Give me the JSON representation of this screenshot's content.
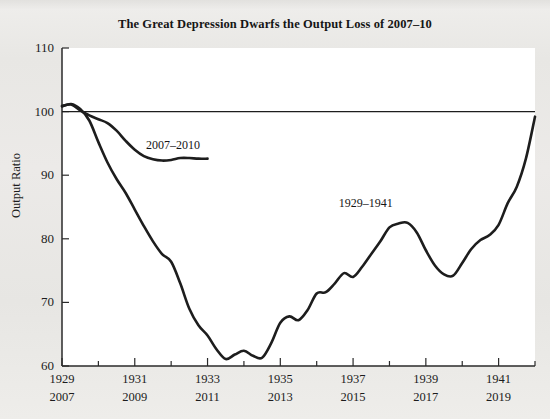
{
  "chart_data": {
    "type": "line",
    "title": "The Great Depression Dwarfs the Output Loss of 2007–10",
    "xlabel": "",
    "ylabel": "Output Ratio",
    "ylim": [
      60,
      110
    ],
    "yticks": [
      60,
      70,
      80,
      90,
      100,
      110
    ],
    "ytick_labels": [
      "60",
      "70",
      "80",
      "90",
      "100",
      "110"
    ],
    "xlim": [
      1929,
      1942
    ],
    "xticks": [
      1929,
      1930,
      1931,
      1932,
      1933,
      1934,
      1935,
      1936,
      1937,
      1938,
      1939,
      1940,
      1941,
      1942
    ],
    "xtick_labels_primary": [
      "1929",
      "1931",
      "1933",
      "1935",
      "1937",
      "1939",
      "1941"
    ],
    "xtick_labels_secondary": [
      "2007",
      "2009",
      "2011",
      "2013",
      "2015",
      "2017",
      "2019"
    ],
    "xtick_label_years": [
      1929,
      1931,
      1933,
      1935,
      1937,
      1939,
      1941
    ],
    "grid": false,
    "legend_position": "inline-annotations",
    "reference_line": {
      "y": 100,
      "label": "",
      "color": "#1d1d1d"
    },
    "annotations": [
      {
        "text": "2007–2010",
        "x": 1932.05,
        "y": 94.6
      },
      {
        "text": "1929–1941",
        "x": 1937.35,
        "y": 85.4
      }
    ],
    "series": [
      {
        "name": "1929–1941",
        "color": "#1d1d1d",
        "x": [
          1929.0,
          1929.25,
          1929.5,
          1929.75,
          1930.0,
          1930.25,
          1930.5,
          1930.75,
          1931.0,
          1931.25,
          1931.5,
          1931.75,
          1932.0,
          1932.25,
          1932.5,
          1932.75,
          1933.0,
          1933.25,
          1933.5,
          1933.75,
          1934.0,
          1934.25,
          1934.5,
          1934.75,
          1935.0,
          1935.25,
          1935.5,
          1935.75,
          1936.0,
          1936.25,
          1936.5,
          1936.75,
          1937.0,
          1937.25,
          1937.5,
          1937.75,
          1938.0,
          1938.25,
          1938.5,
          1938.75,
          1939.0,
          1939.25,
          1939.5,
          1939.75,
          1940.0,
          1940.25,
          1940.5,
          1940.75,
          1941.0,
          1941.25,
          1941.5,
          1941.75,
          1942.0
        ],
        "y": [
          100.8,
          101.2,
          100.4,
          98.6,
          95.2,
          92.0,
          89.4,
          87.2,
          84.6,
          82.0,
          79.6,
          77.6,
          76.4,
          73.0,
          69.0,
          66.4,
          64.8,
          62.6,
          61.1,
          61.8,
          62.4,
          61.6,
          61.3,
          63.6,
          66.8,
          67.8,
          67.2,
          68.8,
          71.4,
          71.6,
          73.0,
          74.6,
          74.0,
          75.6,
          77.6,
          79.6,
          81.8,
          82.4,
          82.5,
          81.0,
          78.2,
          75.8,
          74.4,
          74.2,
          76.2,
          78.4,
          79.8,
          80.6,
          82.2,
          85.6,
          88.2,
          92.6,
          99.2
        ]
      },
      {
        "name": "2007–2010",
        "color": "#1d1d1d",
        "x": [
          1929.0,
          1929.25,
          1929.5,
          1929.75,
          1930.0,
          1930.25,
          1930.5,
          1930.75,
          1931.0,
          1931.25,
          1931.5,
          1931.75,
          1932.0,
          1932.25,
          1932.5,
          1932.75,
          1933.0
        ],
        "y": [
          100.9,
          101.1,
          100.2,
          99.4,
          98.8,
          98.2,
          97.0,
          95.4,
          94.0,
          93.0,
          92.5,
          92.3,
          92.4,
          92.7,
          92.7,
          92.6,
          92.6
        ]
      }
    ]
  }
}
